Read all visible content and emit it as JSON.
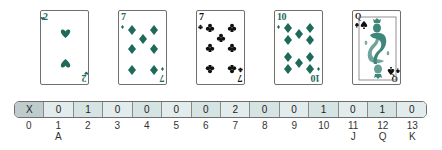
{
  "colors": {
    "suit_green": "#1e6a5a",
    "black": "#111111",
    "card_border": "#6f6f6f",
    "cell_blank": "#bfcccd",
    "cell_light": "#e3ecec",
    "cell_alt": "#d6e3e3"
  },
  "cards": [
    {
      "rank": "2",
      "suit": "hearts",
      "suit_glyph": "♥"
    },
    {
      "rank": "7",
      "suit": "diamonds",
      "suit_glyph": "♦"
    },
    {
      "rank": "7",
      "suit": "clubs",
      "suit_glyph": "♣"
    },
    {
      "rank": "10",
      "suit": "diamonds",
      "suit_glyph": "♦"
    },
    {
      "rank": "Q",
      "suit": "spades",
      "suit_glyph": "♠"
    }
  ],
  "count_array": {
    "cells": [
      "X",
      "0",
      "1",
      "0",
      "0",
      "0",
      "0",
      "2",
      "0",
      "0",
      "1",
      "0",
      "1",
      "0"
    ],
    "indices": [
      "0",
      "1",
      "2",
      "3",
      "4",
      "5",
      "6",
      "7",
      "8",
      "9",
      "10",
      "11",
      "12",
      "13"
    ],
    "face_labels": {
      "1": "A",
      "11": "J",
      "12": "Q",
      "13": "K"
    }
  }
}
